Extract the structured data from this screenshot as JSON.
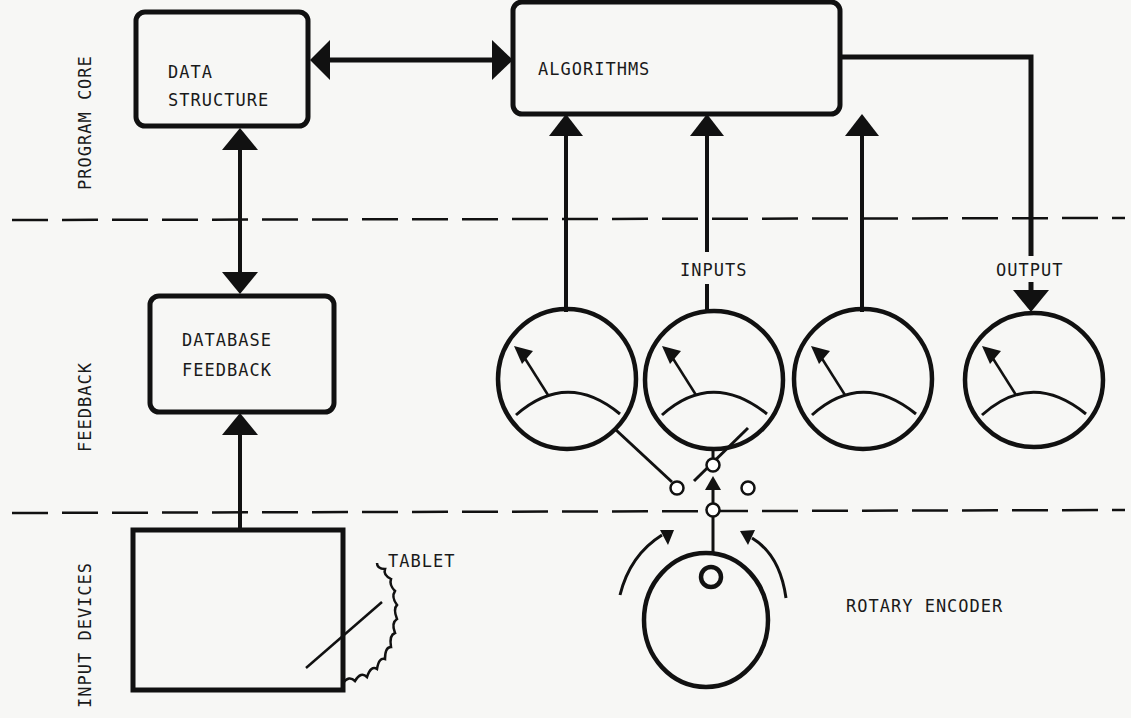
{
  "layers": [
    {
      "label": "PROGRAM CORE"
    },
    {
      "label": "FEEDBACK"
    },
    {
      "label": "INPUT DEVICES"
    }
  ],
  "boxes": {
    "data_structure": {
      "line1": "DATA",
      "line2": "STRUCTURE"
    },
    "algorithms": {
      "label": "ALGORITHMS"
    },
    "database_feedback": {
      "line1": "DATABASE",
      "line2": "FEEDBACK"
    }
  },
  "labels": {
    "inputs": "INPUTS",
    "output": "OUTPUT",
    "tablet": "TABLET",
    "rotary_encoder": "ROTARY ENCODER"
  },
  "meters": {
    "input_count": 3,
    "output_count": 1
  },
  "colors": {
    "ink": "#111111",
    "paper": "#f7f7f5"
  }
}
